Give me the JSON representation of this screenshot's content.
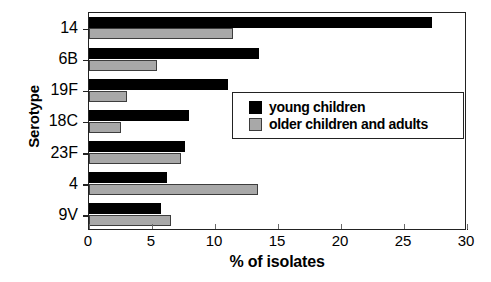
{
  "chart_data": {
    "type": "bar",
    "orientation": "horizontal",
    "title": "",
    "xlabel": "% of isolates",
    "ylabel": "Serotype",
    "categories": [
      "14",
      "6B",
      "19F",
      "18C",
      "23F",
      "4",
      "9V"
    ],
    "series": [
      {
        "name": "young children",
        "color": "#000000",
        "values": [
          27.2,
          13.5,
          11.0,
          7.9,
          7.6,
          6.2,
          5.7
        ]
      },
      {
        "name": "older children and adults",
        "color": "#a8a8a8",
        "values": [
          11.4,
          5.4,
          3.0,
          2.5,
          7.3,
          13.4,
          6.5
        ]
      }
    ],
    "xlim": [
      0,
      30
    ],
    "xticks": [
      0,
      5,
      10,
      15,
      20,
      25,
      30
    ],
    "xtick_labels": [
      "0",
      "5",
      "10",
      "15",
      "20",
      "25",
      "30"
    ],
    "grid": false,
    "legend_position": "center-right",
    "frame": true
  },
  "legend": {
    "entries": [
      {
        "label": "young children",
        "swatch": "dark"
      },
      {
        "label": "older children and adults",
        "swatch": "light"
      }
    ]
  }
}
